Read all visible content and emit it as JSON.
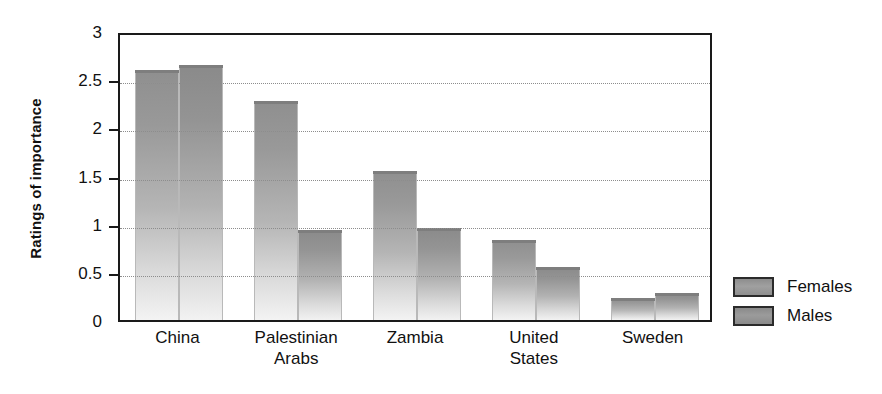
{
  "chart_data": {
    "type": "bar",
    "title": "",
    "xlabel": "",
    "ylabel": "Ratings of importance",
    "ylim": [
      0,
      3
    ],
    "yticks": [
      "0",
      "0.5",
      "1",
      "1.5",
      "2",
      "2.5",
      "3"
    ],
    "ytick_values": [
      0,
      0.5,
      1,
      1.5,
      2,
      2.5,
      3
    ],
    "grid": "horizontal-dotted",
    "legend_position": "right-outside",
    "categories": [
      "China",
      "Palestinian Arabs",
      "Zambia",
      "United States",
      "Sweden"
    ],
    "category_lines": [
      [
        "China"
      ],
      [
        "Palestinian",
        "Arabs"
      ],
      [
        "Zambia"
      ],
      [
        "United",
        "States"
      ],
      [
        "Sweden"
      ]
    ],
    "series": [
      {
        "name": "Females",
        "values": [
          2.6,
          2.27,
          1.55,
          0.83,
          0.23
        ],
        "color": "#989898"
      },
      {
        "name": "Males",
        "values": [
          2.65,
          0.93,
          0.95,
          0.55,
          0.28
        ],
        "color": "#949494"
      }
    ]
  },
  "legend": {
    "items": [
      {
        "label": "Females"
      },
      {
        "label": "Males"
      }
    ]
  },
  "colors": {
    "axis": "#1a1a1a",
    "grid": "#8d8d8d",
    "bar_top": "#8f8f8f",
    "bar_bottom": "#f3f3f3",
    "text": "#111111",
    "background": "#ffffff"
  }
}
